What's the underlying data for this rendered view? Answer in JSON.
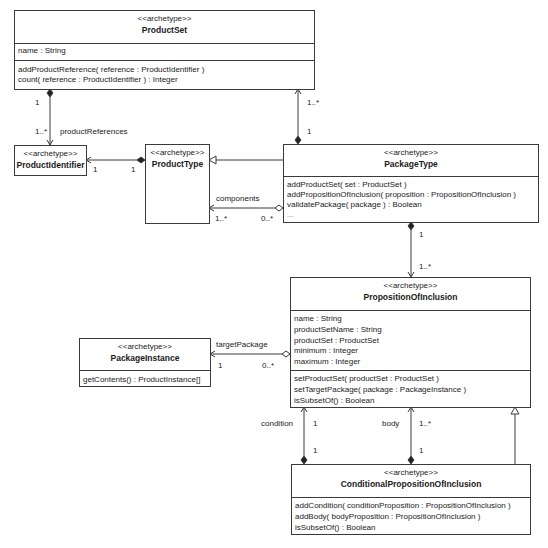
{
  "classes": {
    "product_set": {
      "stereotype": "<<archetype>>",
      "name": "ProductSet",
      "attributes": [
        "name : String"
      ],
      "operations": [
        "addProductReference( reference : ProductIdentifier )",
        "count( reference : ProductIdentifier ) : Integer"
      ]
    },
    "product_identifier": {
      "stereotype": "<<archetype>>",
      "name": "ProductIdentifier"
    },
    "product_type": {
      "stereotype": "<<archetype>>",
      "name": "ProductType"
    },
    "package_type": {
      "stereotype": "<<archetype>>",
      "name": "PackageType",
      "operations": [
        "addProductSet( set : ProductSet )",
        "addPropositionOfInclusion( proposition : PropositionOfInclusion )",
        "validatePackage( package ) : Boolean",
        "..."
      ]
    },
    "proposition_of_inclusion": {
      "stereotype": "<<archetype>>",
      "name": "PropositionOfInclusion",
      "attributes": [
        "name : String",
        "productSetName : String",
        "productSet : ProductSet",
        "minimum : Integer",
        "maximum : Integer"
      ],
      "operations": [
        "setProductSet( productSet : ProductSet )",
        "setTargetPackage( package : PackageInstance )",
        "isSubsetOf() : Boolean"
      ]
    },
    "package_instance": {
      "stereotype": "<<archetype>>",
      "name": "PackageInstance",
      "operations": [
        "getContents() : ProductInstance[]"
      ]
    },
    "conditional_proposition_of_inclusion": {
      "stereotype": "<<archetype>>",
      "name": "ConditionalPropositionOfInclusion",
      "operations": [
        "addCondition( conditionProposition : PropositionOfInclusion )",
        "addBody( bodyProposition : PropositionOfInclusion )",
        "isSubsetOf() : Boolean"
      ]
    }
  },
  "associations": {
    "productset_identifier": {
      "role": "productReferences",
      "source_mult": "1",
      "target_mult": "1..*"
    },
    "producttype_identifier": {
      "source_mult": "1",
      "target_mult": "1"
    },
    "packagetype_productset": {
      "source_mult": "1",
      "target_mult": "1..*"
    },
    "components": {
      "role": "components",
      "source_mult": "0..*",
      "target_mult": "1..*"
    },
    "packagetype_proposition": {
      "source_mult": "1",
      "target_mult": "1..*"
    },
    "target_package": {
      "role": "targetPackage",
      "source_mult": "0..*",
      "target_mult": "1"
    },
    "condition": {
      "role": "condition",
      "source_mult": "1",
      "target_mult": "1"
    },
    "body": {
      "role": "body",
      "source_mult": "1",
      "target_mult": "1..*"
    }
  },
  "colors": {
    "line": "#3a3a3a",
    "text": "#1a1a1a",
    "background": "#ffffff"
  }
}
